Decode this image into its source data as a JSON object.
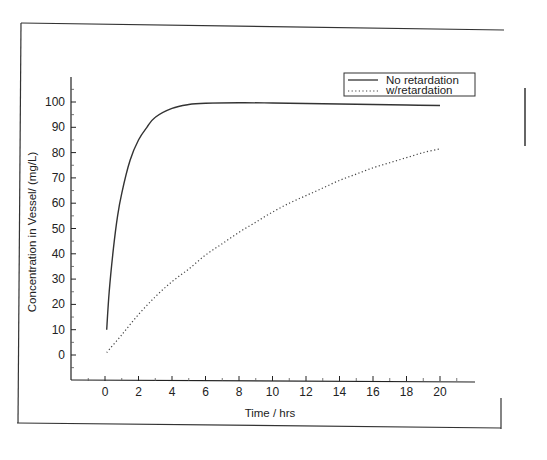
{
  "chart_data": {
    "type": "line",
    "title": "",
    "xlabel": "Time / hrs",
    "ylabel": "Concentration in Vessel/ (mg/L)",
    "xlim": [
      -2,
      22
    ],
    "ylim": [
      -10,
      110
    ],
    "xticks": [
      0,
      2,
      4,
      6,
      8,
      10,
      12,
      14,
      16,
      18,
      20
    ],
    "yticks": [
      0,
      10,
      20,
      30,
      40,
      50,
      60,
      70,
      80,
      90,
      100
    ],
    "grid": false,
    "legend_position": "upper right",
    "series": [
      {
        "name": "No retardation",
        "style": "solid",
        "x": [
          0.1,
          0.25,
          0.5,
          0.75,
          1,
          1.5,
          2,
          2.5,
          3,
          4,
          5,
          6,
          8,
          10,
          12,
          14,
          16,
          18,
          20
        ],
        "values": [
          10,
          25,
          42,
          55,
          64,
          77,
          85,
          90,
          94,
          97.5,
          99,
          99.5,
          99.7,
          99.6,
          99.4,
          99.2,
          99,
          98.8,
          98.6
        ]
      },
      {
        "name": "w/retardation",
        "style": "dotted",
        "x": [
          0.1,
          1,
          2,
          3,
          4,
          5,
          6,
          7,
          8,
          9,
          10,
          11,
          12,
          13,
          14,
          15,
          16,
          17,
          18,
          19,
          20
        ],
        "values": [
          1,
          8,
          16,
          23,
          29,
          34,
          39.5,
          44,
          48.5,
          52.5,
          56.5,
          60,
          63,
          66,
          69,
          71.5,
          74,
          76,
          78,
          80,
          81.5
        ]
      }
    ]
  },
  "legend": {
    "items": [
      {
        "label": "No retardation",
        "style": "solid"
      },
      {
        "label": "w/retardation",
        "style": "dotted"
      }
    ]
  }
}
